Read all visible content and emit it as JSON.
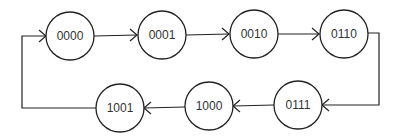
{
  "diagram": {
    "type": "state-transition-cycle",
    "nodes": [
      {
        "id": "n0",
        "label": "0000",
        "cx": 70,
        "cy": 36
      },
      {
        "id": "n1",
        "label": "0001",
        "cx": 162,
        "cy": 35
      },
      {
        "id": "n2",
        "label": "0010",
        "cx": 254,
        "cy": 34
      },
      {
        "id": "n3",
        "label": "0110",
        "cx": 344,
        "cy": 34
      },
      {
        "id": "n4",
        "label": "0111",
        "cx": 298,
        "cy": 105
      },
      {
        "id": "n5",
        "label": "1000",
        "cx": 209,
        "cy": 106
      },
      {
        "id": "n6",
        "label": "1001",
        "cx": 120,
        "cy": 108
      }
    ],
    "edges": [
      {
        "from": "0000",
        "to": "0001"
      },
      {
        "from": "0001",
        "to": "0010"
      },
      {
        "from": "0010",
        "to": "0110"
      },
      {
        "from": "0110",
        "to": "0111"
      },
      {
        "from": "0111",
        "to": "1000"
      },
      {
        "from": "1000",
        "to": "1001"
      },
      {
        "from": "1001",
        "to": "0000"
      }
    ],
    "colors": {
      "stroke": "#222222",
      "text": "#333333",
      "background": "#ffffff"
    }
  }
}
